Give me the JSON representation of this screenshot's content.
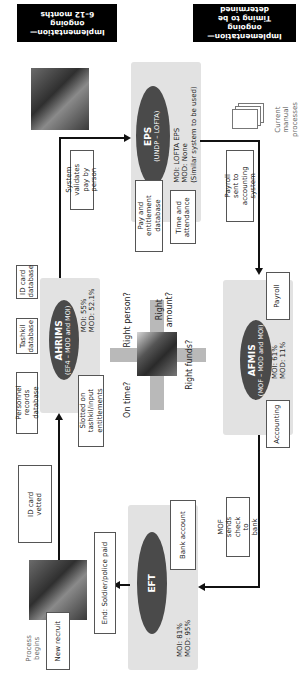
{
  "status_banners": {
    "left": {
      "line1": "Implementation—",
      "line2": "ongoing",
      "line3": "6–12 months"
    },
    "right": {
      "line1": "Implementation—",
      "line2": "ongoing",
      "line3": "Timing to be determined"
    }
  },
  "systems": {
    "eps": {
      "name": "EPS",
      "owner": "(UNDP – LOFTA)",
      "stat1": "MOI: LOFTA EPS",
      "stat2": "MOD: None",
      "stat3": "(Similar system to be used)",
      "modules": [
        "Pay and entitlement database",
        "Time and attendance"
      ]
    },
    "ahrims": {
      "name": "AHRIMS",
      "owner": "(EF4 – MOD and MOI)",
      "stat1": "MOI: 55%",
      "stat2": "MOD: 52.1%",
      "modules": [
        "Personnel records database",
        "Tashkil database",
        "ID card database"
      ]
    },
    "afmis": {
      "name": "AFMIS",
      "owner": "(MOF – MOD and MOI)",
      "stat1": "MOI: 61%",
      "stat2": "MOD: 11%",
      "modules": [
        "Accounting",
        "Payroll"
      ]
    },
    "eft": {
      "name": "EFT",
      "stat1": "MOI: 81%",
      "stat2": "MOD: 95%",
      "modules": [
        "Bank account"
      ]
    }
  },
  "flow_steps": {
    "process_begins": "Process begins",
    "new_recruit": "New recruit",
    "id_card_vetted": "ID card vetted",
    "slotted": "Slotted on tashkil/input entitlements",
    "validates": "System validates pay by person",
    "payroll_sent": "Payroll sent to accounting system",
    "mof_sends": "MOF sends check to bank",
    "end": "End: Soldier/police paid",
    "current_manual": "Current manual processes"
  },
  "center_questions": {
    "right_person": "Right person?",
    "right_amount": "Right amount?",
    "on_time": "On time?",
    "right_funds": "Right funds?"
  }
}
